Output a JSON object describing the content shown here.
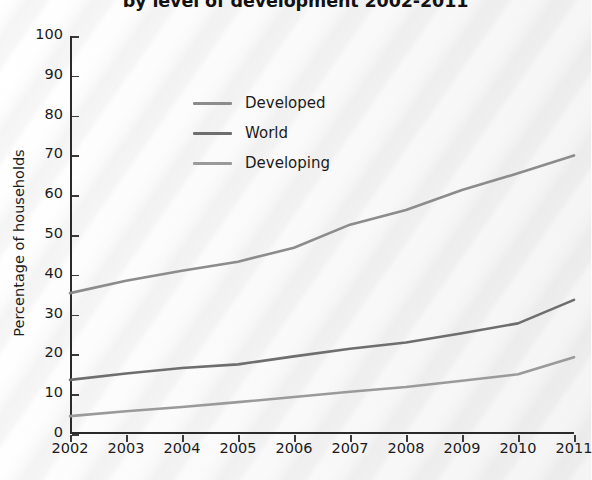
{
  "chart_data": {
    "type": "line",
    "title": "by level of development 2002-2011",
    "xlabel": "",
    "ylabel": "Percentage of households",
    "x": [
      2002,
      2003,
      2004,
      2005,
      2006,
      2007,
      2008,
      2009,
      2010,
      2011
    ],
    "xticklabels": [
      "2002",
      "2003",
      "2004",
      "2005",
      "2006",
      "2007",
      "2008",
      "2009",
      "2010",
      "2011"
    ],
    "yticklabels": [
      "0",
      "10",
      "20",
      "30",
      "40",
      "50",
      "60",
      "70",
      "80",
      "90",
      "100"
    ],
    "ylim": [
      0,
      100
    ],
    "xlim": [
      2002,
      2011
    ],
    "grid": false,
    "legend_position": "upper-center-left",
    "series": [
      {
        "name": "Developed",
        "color": "#8c8c8c",
        "values": [
          35.4,
          38.5,
          41.0,
          43.3,
          46.8,
          52.6,
          56.3,
          61.3,
          65.5,
          70.0
        ]
      },
      {
        "name": "World",
        "color": "#6e6e6e",
        "values": [
          13.6,
          15.2,
          16.6,
          17.5,
          19.5,
          21.4,
          23.0,
          25.3,
          27.8,
          33.7
        ]
      },
      {
        "name": "Developing",
        "color": "#9a9a9a",
        "values": [
          4.5,
          5.7,
          6.8,
          8.0,
          9.3,
          10.6,
          11.8,
          13.4,
          15.0,
          19.3
        ]
      }
    ]
  },
  "legend": {
    "items": [
      {
        "label": "Developed",
        "color": "#8c8c8c"
      },
      {
        "label": "World",
        "color": "#6e6e6e"
      },
      {
        "label": "Developing",
        "color": "#9a9a9a"
      }
    ]
  }
}
